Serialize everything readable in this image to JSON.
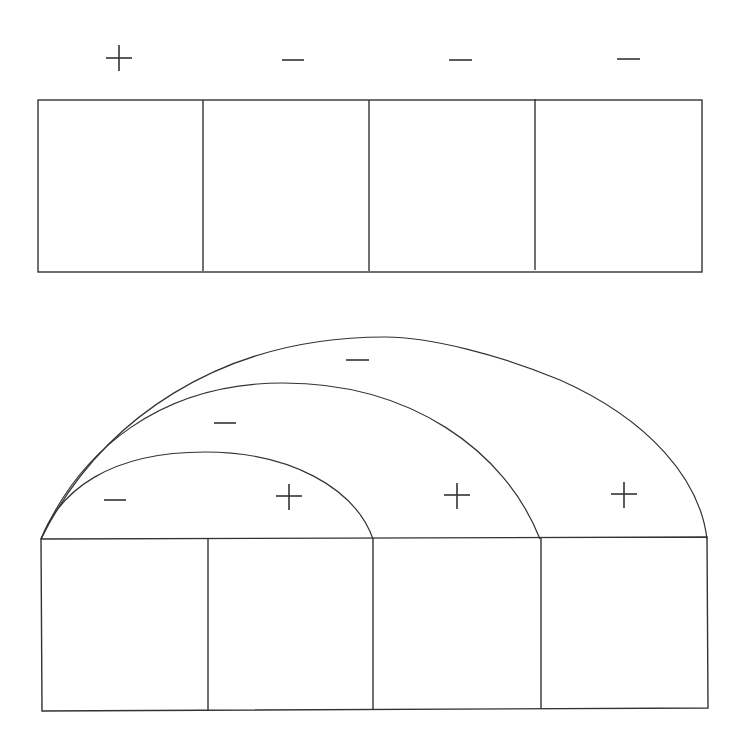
{
  "top_panel": {
    "signs": [
      "+",
      "−",
      "−",
      "−"
    ],
    "cells": 4
  },
  "bottom_panel": {
    "cell_signs_inner_arc": [
      "−",
      "+"
    ],
    "middle_arc_signs": [
      "−",
      "+"
    ],
    "outer_arc_signs": [
      "−",
      "+"
    ],
    "cells": 4,
    "arcs": 3
  },
  "colors": {
    "stroke": "#333333",
    "background": "#ffffff"
  }
}
